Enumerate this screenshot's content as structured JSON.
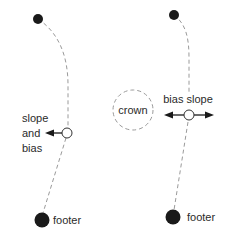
{
  "diagram": {
    "title": "",
    "colors": {
      "node_fill": "#1a1a1a",
      "dashed_line": "#9a9a9a",
      "open_node_stroke": "#333333",
      "arrow": "#1a1a1a",
      "text": "#2a2a2a"
    },
    "left_chain": {
      "top_node": {
        "shape": "filled-circle"
      },
      "control_node": {
        "shape": "open-circle"
      },
      "control_label_lines": [
        "slope",
        "and",
        "bias"
      ],
      "control_arrow": "arrow-left",
      "footer_node": {
        "shape": "filled-circle"
      },
      "footer_label": "footer"
    },
    "center": {
      "crown_label": "crown",
      "crown_shape": "dashed-circle"
    },
    "right_chain": {
      "top_node": {
        "shape": "filled-circle"
      },
      "control_node": {
        "shape": "open-circle"
      },
      "control_label": "bias slope",
      "control_arrow": "double-arrow-horizontal",
      "footer_node": {
        "shape": "filled-circle"
      },
      "footer_label": "footer"
    }
  }
}
